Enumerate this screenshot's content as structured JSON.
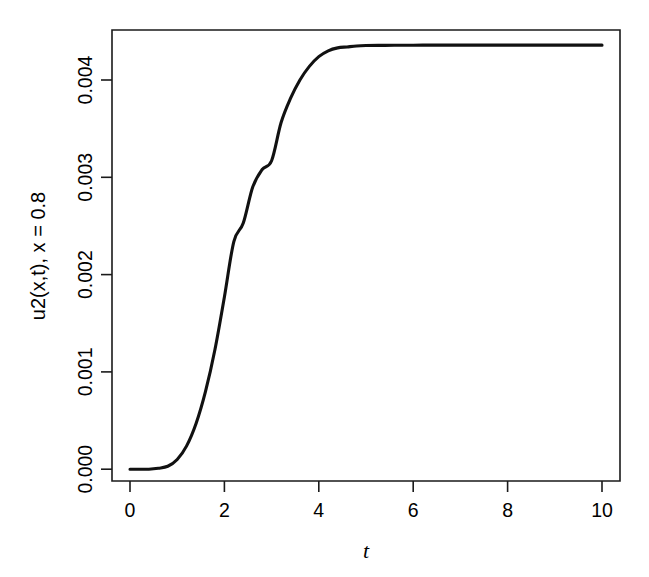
{
  "chart_data": {
    "type": "line",
    "title": "",
    "xlabel": "t",
    "ylabel": "u2(x,t), x = 0.8",
    "xlim": [
      0,
      10
    ],
    "ylim": [
      0.0,
      0.00455
    ],
    "grid": false,
    "legend": null,
    "xticks": [
      0,
      2,
      4,
      6,
      8,
      10
    ],
    "xticklabels": [
      "0",
      "2",
      "4",
      "6",
      "8",
      "10"
    ],
    "yticks": [
      0.0,
      0.001,
      0.002,
      0.003,
      0.004
    ],
    "yticklabels": [
      "0.000",
      "0.001",
      "0.002",
      "0.003",
      "0.004"
    ],
    "series": [
      {
        "name": "u2(x,t) at x = 0.8",
        "color": "#111111",
        "x": [
          0.0,
          0.2,
          0.4,
          0.6,
          0.8,
          1.0,
          1.2,
          1.4,
          1.6,
          1.8,
          2.0,
          2.2,
          2.4,
          2.6,
          2.8,
          3.0,
          3.2,
          3.4,
          3.6,
          3.8,
          4.0,
          4.2,
          4.4,
          4.6,
          4.8,
          5.0,
          5.4,
          5.8,
          6.2,
          6.6,
          7.0,
          7.5,
          8.0,
          8.5,
          9.0,
          9.5,
          10.0
        ],
        "y": [
          0.0,
          0.0,
          0.0,
          1e-05,
          3e-05,
          0.0001,
          0.00024,
          0.00047,
          0.0008,
          0.00123,
          0.00177,
          0.00234,
          0.00253,
          0.0029,
          0.00308,
          0.00317,
          0.00356,
          0.00381,
          0.004,
          0.00414,
          0.00424,
          0.0043,
          0.00433,
          0.00434,
          0.00435,
          0.004354,
          0.004356,
          0.004357,
          0.004358,
          0.004358,
          0.004358,
          0.004358,
          0.004358,
          0.004358,
          0.004358,
          0.004358,
          0.004358
        ]
      }
    ],
    "plateau_value": 0.004358
  },
  "axis_labels": {
    "y_axis_title": "u2(x,t), x = 0.8",
    "x_axis_title": "t"
  }
}
